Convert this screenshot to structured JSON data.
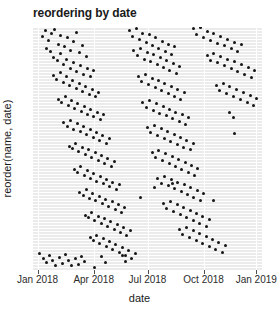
{
  "chart_data": {
    "type": "scatter",
    "title": "reordering by date",
    "xlabel": "date",
    "ylabel": "reorder(name, date)",
    "xlim": [
      "2018-01-01",
      "2019-01-15"
    ],
    "ylim": [
      0,
      1
    ],
    "grid": true,
    "legend": false,
    "xticklabels": [
      "Jan 2018",
      "Apr 2018",
      "Jul 2018",
      "Oct 2018",
      "Jan 2019"
    ],
    "xtick_positions_frac": [
      0.02,
      0.265,
      0.5,
      0.745,
      0.975
    ],
    "yticklabels": [],
    "point_color": "#151515",
    "panel_color": "#ebebeb",
    "gridline_color": "#ffffff",
    "n_points": 284,
    "points": [
      [
        0.04,
        0.962
      ],
      [
        0.055,
        0.985
      ],
      [
        0.068,
        0.944
      ],
      [
        0.082,
        0.972
      ],
      [
        0.095,
        0.99
      ],
      [
        0.11,
        0.93
      ],
      [
        0.122,
        0.966
      ],
      [
        0.138,
        0.918
      ],
      [
        0.15,
        0.955
      ],
      [
        0.165,
        0.905
      ],
      [
        0.176,
        0.94
      ],
      [
        0.19,
        0.978
      ],
      [
        0.205,
        0.896
      ],
      [
        0.218,
        0.925
      ],
      [
        0.232,
        0.88
      ],
      [
        0.06,
        0.912
      ],
      [
        0.075,
        0.898
      ],
      [
        0.09,
        0.875
      ],
      [
        0.105,
        0.862
      ],
      [
        0.12,
        0.89
      ],
      [
        0.135,
        0.845
      ],
      [
        0.148,
        0.868
      ],
      [
        0.162,
        0.83
      ],
      [
        0.178,
        0.855
      ],
      [
        0.192,
        0.818
      ],
      [
        0.208,
        0.842
      ],
      [
        0.222,
        0.806
      ],
      [
        0.236,
        0.828
      ],
      [
        0.25,
        0.795
      ],
      [
        0.264,
        0.82
      ],
      [
        0.088,
        0.8
      ],
      [
        0.102,
        0.782
      ],
      [
        0.118,
        0.812
      ],
      [
        0.132,
        0.77
      ],
      [
        0.146,
        0.795
      ],
      [
        0.16,
        0.758
      ],
      [
        0.174,
        0.78
      ],
      [
        0.188,
        0.745
      ],
      [
        0.202,
        0.768
      ],
      [
        0.216,
        0.735
      ],
      [
        0.23,
        0.756
      ],
      [
        0.245,
        0.722
      ],
      [
        0.258,
        0.744
      ],
      [
        0.272,
        0.712
      ],
      [
        0.286,
        0.732
      ],
      [
        0.112,
        0.7
      ],
      [
        0.126,
        0.688
      ],
      [
        0.14,
        0.715
      ],
      [
        0.155,
        0.676
      ],
      [
        0.168,
        0.698
      ],
      [
        0.182,
        0.664
      ],
      [
        0.196,
        0.686
      ],
      [
        0.21,
        0.652
      ],
      [
        0.225,
        0.674
      ],
      [
        0.238,
        0.64
      ],
      [
        0.252,
        0.662
      ],
      [
        0.266,
        0.63
      ],
      [
        0.28,
        0.65
      ],
      [
        0.294,
        0.618
      ],
      [
        0.308,
        0.638
      ],
      [
        0.135,
        0.605
      ],
      [
        0.15,
        0.592
      ],
      [
        0.164,
        0.616
      ],
      [
        0.178,
        0.58
      ],
      [
        0.193,
        0.602
      ],
      [
        0.207,
        0.568
      ],
      [
        0.221,
        0.59
      ],
      [
        0.235,
        0.556
      ],
      [
        0.249,
        0.578
      ],
      [
        0.263,
        0.545
      ],
      [
        0.277,
        0.566
      ],
      [
        0.291,
        0.533
      ],
      [
        0.305,
        0.554
      ],
      [
        0.319,
        0.521
      ],
      [
        0.333,
        0.542
      ],
      [
        0.158,
        0.51
      ],
      [
        0.172,
        0.498
      ],
      [
        0.186,
        0.522
      ],
      [
        0.2,
        0.486
      ],
      [
        0.215,
        0.506
      ],
      [
        0.229,
        0.474
      ],
      [
        0.243,
        0.494
      ],
      [
        0.257,
        0.462
      ],
      [
        0.271,
        0.482
      ],
      [
        0.285,
        0.45
      ],
      [
        0.299,
        0.47
      ],
      [
        0.313,
        0.438
      ],
      [
        0.327,
        0.458
      ],
      [
        0.341,
        0.426
      ],
      [
        0.355,
        0.446
      ],
      [
        0.18,
        0.415
      ],
      [
        0.195,
        0.402
      ],
      [
        0.209,
        0.425
      ],
      [
        0.223,
        0.39
      ],
      [
        0.237,
        0.41
      ],
      [
        0.251,
        0.378
      ],
      [
        0.265,
        0.398
      ],
      [
        0.279,
        0.366
      ],
      [
        0.293,
        0.386
      ],
      [
        0.307,
        0.354
      ],
      [
        0.321,
        0.374
      ],
      [
        0.335,
        0.342
      ],
      [
        0.349,
        0.362
      ],
      [
        0.363,
        0.33
      ],
      [
        0.377,
        0.35
      ],
      [
        0.205,
        0.32
      ],
      [
        0.219,
        0.308
      ],
      [
        0.233,
        0.33
      ],
      [
        0.247,
        0.296
      ],
      [
        0.261,
        0.316
      ],
      [
        0.275,
        0.284
      ],
      [
        0.289,
        0.304
      ],
      [
        0.303,
        0.272
      ],
      [
        0.317,
        0.292
      ],
      [
        0.331,
        0.26
      ],
      [
        0.345,
        0.28
      ],
      [
        0.359,
        0.248
      ],
      [
        0.373,
        0.268
      ],
      [
        0.387,
        0.236
      ],
      [
        0.401,
        0.256
      ],
      [
        0.228,
        0.226
      ],
      [
        0.242,
        0.214
      ],
      [
        0.256,
        0.236
      ],
      [
        0.27,
        0.202
      ],
      [
        0.284,
        0.222
      ],
      [
        0.298,
        0.19
      ],
      [
        0.312,
        0.21
      ],
      [
        0.326,
        0.178
      ],
      [
        0.34,
        0.198
      ],
      [
        0.354,
        0.166
      ],
      [
        0.368,
        0.186
      ],
      [
        0.382,
        0.154
      ],
      [
        0.396,
        0.174
      ],
      [
        0.41,
        0.142
      ],
      [
        0.424,
        0.162
      ],
      [
        0.25,
        0.132
      ],
      [
        0.264,
        0.12
      ],
      [
        0.278,
        0.142
      ],
      [
        0.292,
        0.108
      ],
      [
        0.306,
        0.128
      ],
      [
        0.32,
        0.096
      ],
      [
        0.334,
        0.116
      ],
      [
        0.348,
        0.084
      ],
      [
        0.362,
        0.104
      ],
      [
        0.376,
        0.072
      ],
      [
        0.39,
        0.092
      ],
      [
        0.404,
        0.06
      ],
      [
        0.418,
        0.08
      ],
      [
        0.432,
        0.048
      ],
      [
        0.446,
        0.068
      ],
      [
        0.03,
        0.068
      ],
      [
        0.045,
        0.048
      ],
      [
        0.058,
        0.03
      ],
      [
        0.072,
        0.058
      ],
      [
        0.086,
        0.038
      ],
      [
        0.1,
        0.02
      ],
      [
        0.115,
        0.05
      ],
      [
        0.128,
        0.028
      ],
      [
        0.142,
        0.062
      ],
      [
        0.156,
        0.04
      ],
      [
        0.17,
        0.018
      ],
      [
        0.184,
        0.046
      ],
      [
        0.198,
        0.024
      ],
      [
        0.212,
        0.056
      ],
      [
        0.226,
        0.034
      ],
      [
        0.42,
        0.985
      ],
      [
        0.435,
        0.962
      ],
      [
        0.45,
        0.992
      ],
      [
        0.465,
        0.948
      ],
      [
        0.48,
        0.975
      ],
      [
        0.494,
        0.936
      ],
      [
        0.508,
        0.968
      ],
      [
        0.522,
        0.922
      ],
      [
        0.536,
        0.955
      ],
      [
        0.55,
        0.91
      ],
      [
        0.564,
        0.942
      ],
      [
        0.578,
        0.9
      ],
      [
        0.592,
        0.93
      ],
      [
        0.606,
        0.888
      ],
      [
        0.62,
        0.918
      ],
      [
        0.44,
        0.905
      ],
      [
        0.455,
        0.882
      ],
      [
        0.47,
        0.912
      ],
      [
        0.485,
        0.868
      ],
      [
        0.5,
        0.895
      ],
      [
        0.514,
        0.856
      ],
      [
        0.528,
        0.886
      ],
      [
        0.542,
        0.844
      ],
      [
        0.556,
        0.874
      ],
      [
        0.57,
        0.832
      ],
      [
        0.584,
        0.862
      ],
      [
        0.598,
        0.82
      ],
      [
        0.612,
        0.85
      ],
      [
        0.626,
        0.808
      ],
      [
        0.64,
        0.838
      ],
      [
        0.46,
        0.796
      ],
      [
        0.475,
        0.775
      ],
      [
        0.49,
        0.804
      ],
      [
        0.505,
        0.762
      ],
      [
        0.52,
        0.79
      ],
      [
        0.534,
        0.75
      ],
      [
        0.548,
        0.78
      ],
      [
        0.562,
        0.738
      ],
      [
        0.576,
        0.768
      ],
      [
        0.59,
        0.726
      ],
      [
        0.604,
        0.756
      ],
      [
        0.618,
        0.714
      ],
      [
        0.632,
        0.744
      ],
      [
        0.646,
        0.702
      ],
      [
        0.66,
        0.732
      ],
      [
        0.48,
        0.69
      ],
      [
        0.495,
        0.67
      ],
      [
        0.51,
        0.698
      ],
      [
        0.525,
        0.658
      ],
      [
        0.54,
        0.686
      ],
      [
        0.554,
        0.646
      ],
      [
        0.568,
        0.674
      ],
      [
        0.582,
        0.634
      ],
      [
        0.596,
        0.662
      ],
      [
        0.61,
        0.622
      ],
      [
        0.624,
        0.65
      ],
      [
        0.638,
        0.61
      ],
      [
        0.652,
        0.638
      ],
      [
        0.666,
        0.598
      ],
      [
        0.68,
        0.626
      ],
      [
        0.5,
        0.586
      ],
      [
        0.515,
        0.566
      ],
      [
        0.53,
        0.594
      ],
      [
        0.545,
        0.554
      ],
      [
        0.56,
        0.582
      ],
      [
        0.574,
        0.542
      ],
      [
        0.588,
        0.57
      ],
      [
        0.602,
        0.53
      ],
      [
        0.616,
        0.558
      ],
      [
        0.63,
        0.518
      ],
      [
        0.644,
        0.546
      ],
      [
        0.658,
        0.506
      ],
      [
        0.672,
        0.534
      ],
      [
        0.686,
        0.494
      ],
      [
        0.7,
        0.522
      ],
      [
        0.52,
        0.482
      ],
      [
        0.535,
        0.462
      ],
      [
        0.55,
        0.49
      ],
      [
        0.565,
        0.45
      ],
      [
        0.58,
        0.478
      ],
      [
        0.594,
        0.438
      ],
      [
        0.608,
        0.466
      ],
      [
        0.622,
        0.426
      ],
      [
        0.636,
        0.454
      ],
      [
        0.65,
        0.414
      ],
      [
        0.664,
        0.442
      ],
      [
        0.678,
        0.402
      ],
      [
        0.692,
        0.43
      ],
      [
        0.706,
        0.39
      ],
      [
        0.72,
        0.418
      ],
      [
        0.545,
        0.378
      ],
      [
        0.56,
        0.358
      ],
      [
        0.575,
        0.386
      ],
      [
        0.59,
        0.346
      ],
      [
        0.605,
        0.374
      ],
      [
        0.619,
        0.334
      ],
      [
        0.633,
        0.362
      ],
      [
        0.647,
        0.322
      ],
      [
        0.661,
        0.35
      ],
      [
        0.675,
        0.31
      ],
      [
        0.689,
        0.338
      ],
      [
        0.703,
        0.298
      ],
      [
        0.717,
        0.326
      ],
      [
        0.731,
        0.286
      ],
      [
        0.745,
        0.314
      ],
      [
        0.57,
        0.272
      ],
      [
        0.585,
        0.252
      ],
      [
        0.6,
        0.28
      ],
      [
        0.615,
        0.24
      ],
      [
        0.63,
        0.268
      ],
      [
        0.644,
        0.228
      ],
      [
        0.658,
        0.256
      ],
      [
        0.672,
        0.216
      ],
      [
        0.686,
        0.244
      ],
      [
        0.7,
        0.204
      ],
      [
        0.714,
        0.232
      ],
      [
        0.728,
        0.192
      ],
      [
        0.742,
        0.22
      ],
      [
        0.756,
        0.18
      ],
      [
        0.77,
        0.208
      ],
      [
        0.7,
        0.992
      ],
      [
        0.715,
        0.97
      ],
      [
        0.73,
        0.996
      ],
      [
        0.745,
        0.958
      ],
      [
        0.76,
        0.982
      ],
      [
        0.775,
        0.946
      ],
      [
        0.79,
        0.974
      ],
      [
        0.805,
        0.934
      ],
      [
        0.82,
        0.962
      ],
      [
        0.835,
        0.922
      ],
      [
        0.85,
        0.95
      ],
      [
        0.865,
        0.91
      ],
      [
        0.88,
        0.938
      ],
      [
        0.895,
        0.898
      ],
      [
        0.91,
        0.926
      ],
      [
        0.76,
        0.884
      ],
      [
        0.775,
        0.864
      ],
      [
        0.79,
        0.892
      ],
      [
        0.805,
        0.852
      ],
      [
        0.82,
        0.88
      ],
      [
        0.835,
        0.84
      ],
      [
        0.85,
        0.868
      ],
      [
        0.865,
        0.828
      ],
      [
        0.88,
        0.856
      ],
      [
        0.895,
        0.816
      ],
      [
        0.91,
        0.844
      ],
      [
        0.925,
        0.804
      ],
      [
        0.94,
        0.832
      ],
      [
        0.955,
        0.792
      ],
      [
        0.968,
        0.82
      ],
      [
        0.8,
        0.76
      ],
      [
        0.815,
        0.738
      ],
      [
        0.83,
        0.766
      ],
      [
        0.845,
        0.726
      ],
      [
        0.86,
        0.754
      ],
      [
        0.875,
        0.714
      ],
      [
        0.89,
        0.742
      ],
      [
        0.905,
        0.702
      ],
      [
        0.92,
        0.73
      ],
      [
        0.935,
        0.69
      ],
      [
        0.95,
        0.718
      ],
      [
        0.962,
        0.678
      ],
      [
        0.974,
        0.706
      ],
      [
        0.86,
        0.65
      ],
      [
        0.875,
        0.628
      ],
      [
        0.64,
        0.166
      ],
      [
        0.655,
        0.146
      ],
      [
        0.67,
        0.174
      ],
      [
        0.685,
        0.134
      ],
      [
        0.7,
        0.162
      ],
      [
        0.714,
        0.122
      ],
      [
        0.728,
        0.15
      ],
      [
        0.742,
        0.11
      ],
      [
        0.756,
        0.138
      ],
      [
        0.77,
        0.098
      ],
      [
        0.784,
        0.126
      ],
      [
        0.798,
        0.086
      ],
      [
        0.812,
        0.114
      ],
      [
        0.826,
        0.074
      ],
      [
        0.84,
        0.102
      ],
      [
        0.39,
        0.06
      ],
      [
        0.405,
        0.035
      ],
      [
        0.3,
        0.055
      ],
      [
        0.315,
        0.03
      ],
      [
        0.268,
        0.012
      ],
      [
        0.47,
        0.3
      ],
      [
        0.53,
        0.34
      ],
      [
        0.61,
        0.355
      ],
      [
        0.79,
        0.285
      ],
      [
        0.88,
        0.56
      ]
    ]
  }
}
